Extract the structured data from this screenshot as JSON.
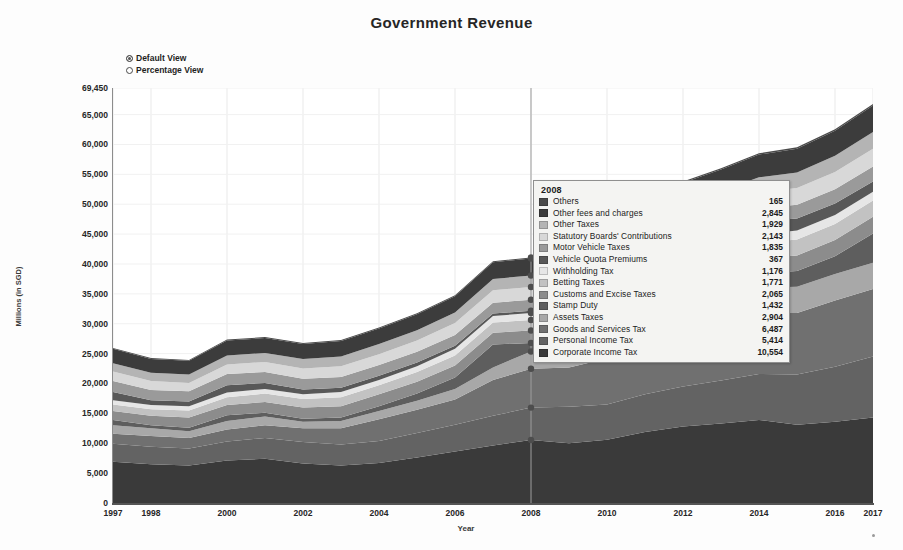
{
  "header": {
    "title": "Government Revenue"
  },
  "view_toggle": {
    "options": [
      {
        "label": "Default View",
        "selected": true
      },
      {
        "label": "Percentage View",
        "selected": false
      }
    ]
  },
  "tooltip": {
    "year": "2008",
    "rows": [
      {
        "name": "Others",
        "value": "165",
        "color": "#4a4a4a"
      },
      {
        "name": "Other fees and charges",
        "value": "2,845",
        "color": "#3c3c3c"
      },
      {
        "name": "Other Taxes",
        "value": "1,929",
        "color": "#b4b4b4"
      },
      {
        "name": "Statutory Boards' Contributions",
        "value": "2,143",
        "color": "#d8d8d8"
      },
      {
        "name": "Motor Vehicle Taxes",
        "value": "1,835",
        "color": "#9a9a9a"
      },
      {
        "name": "Vehicle Quota Premiums",
        "value": "367",
        "color": "#585858"
      },
      {
        "name": "Withholding Tax",
        "value": "1,176",
        "color": "#e6e6e6"
      },
      {
        "name": "Betting Taxes",
        "value": "1,771",
        "color": "#c2c2c2"
      },
      {
        "name": "Customs and Excise Taxes",
        "value": "2,065",
        "color": "#8c8c8c"
      },
      {
        "name": "Stamp Duty",
        "value": "1,432",
        "color": "#5e5e5e"
      },
      {
        "name": "Assets Taxes",
        "value": "2,904",
        "color": "#a8a8a8"
      },
      {
        "name": "Goods and Services Tax",
        "value": "6,487",
        "color": "#707070"
      },
      {
        "name": "Personal Income Tax",
        "value": "5,414",
        "color": "#636363"
      },
      {
        "name": "Corporate Income Tax",
        "value": "10,554",
        "color": "#3a3a3a"
      }
    ]
  },
  "chart_data": {
    "type": "area",
    "title": "Government Revenue",
    "xlabel": "Year",
    "ylabel": "Millions (in SGD)",
    "ylim": [
      0,
      69450
    ],
    "grid": true,
    "legend_position": "tooltip",
    "stacked": true,
    "y_ticks": [
      "0",
      "5,000",
      "10,000",
      "15,000",
      "20,000",
      "25,000",
      "30,000",
      "35,000",
      "40,000",
      "45,000",
      "50,000",
      "55,000",
      "60,000",
      "65,000",
      "69,450"
    ],
    "y_tick_values": [
      0,
      5000,
      10000,
      15000,
      20000,
      25000,
      30000,
      35000,
      40000,
      45000,
      50000,
      55000,
      60000,
      65000,
      69450
    ],
    "x_tick_labels": [
      "1997",
      "1998",
      "2000",
      "2002",
      "2004",
      "2006",
      "2008",
      "2010",
      "2012",
      "2014",
      "2016",
      "2017"
    ],
    "x_tick_values": [
      1997,
      1998,
      2000,
      2002,
      2004,
      2006,
      2008,
      2010,
      2012,
      2014,
      2016,
      2017
    ],
    "x": [
      1997,
      1998,
      1999,
      2000,
      2001,
      2002,
      2003,
      2004,
      2005,
      2006,
      2007,
      2008,
      2009,
      2010,
      2011,
      2012,
      2013,
      2014,
      2015,
      2016,
      2017
    ],
    "series": [
      {
        "name": "Corporate Income Tax",
        "color": "#3a3a3a",
        "values": [
          6900,
          6500,
          6300,
          7100,
          7400,
          6600,
          6300,
          6700,
          7600,
          8600,
          9600,
          10554,
          10000,
          10600,
          11900,
          12800,
          13300,
          13900,
          13100,
          13600,
          14300
        ]
      },
      {
        "name": "Personal Income Tax",
        "color": "#636363",
        "values": [
          3000,
          2900,
          2800,
          3200,
          3500,
          3600,
          3500,
          3700,
          4100,
          4500,
          5000,
          5414,
          6100,
          5900,
          6300,
          6700,
          7200,
          7700,
          8400,
          9200,
          10200
        ]
      },
      {
        "name": "Goods and Services Tax",
        "color": "#707070",
        "values": [
          1700,
          1800,
          1800,
          2000,
          2100,
          2300,
          2700,
          3600,
          3900,
          4200,
          6000,
          6487,
          6600,
          7700,
          8700,
          9000,
          9500,
          10200,
          10300,
          11100,
          11300
        ]
      },
      {
        "name": "Assets Taxes",
        "color": "#a8a8a8",
        "values": [
          1400,
          1300,
          1100,
          1400,
          1500,
          1100,
          1200,
          1400,
          1500,
          1800,
          2100,
          2904,
          2500,
          2800,
          3500,
          3800,
          4100,
          4200,
          4400,
          4400,
          4400
        ]
      },
      {
        "name": "Stamp Duty",
        "color": "#5e5e5e",
        "values": [
          900,
          500,
          600,
          1000,
          600,
          500,
          600,
          800,
          1200,
          1900,
          3800,
          1432,
          1200,
          2900,
          4000,
          3000,
          2500,
          2400,
          2600,
          3000,
          4900
        ]
      },
      {
        "name": "Customs and Excise Taxes",
        "color": "#8c8c8c",
        "values": [
          1500,
          1600,
          1700,
          1700,
          1800,
          1900,
          1900,
          2000,
          2000,
          2000,
          2000,
          2065,
          2100,
          2200,
          2300,
          2400,
          2400,
          2500,
          2600,
          2700,
          2800
        ]
      },
      {
        "name": "Betting Taxes",
        "color": "#c2c2c2",
        "values": [
          1100,
          1100,
          1200,
          1300,
          1400,
          1400,
          1500,
          1500,
          1600,
          1700,
          1700,
          1771,
          1800,
          1900,
          2300,
          2400,
          2500,
          2600,
          2700,
          2700,
          2700
        ]
      },
      {
        "name": "Withholding Tax",
        "color": "#e6e6e6",
        "values": [
          700,
          700,
          700,
          800,
          800,
          800,
          900,
          900,
          1000,
          1100,
          1100,
          1176,
          1100,
          1200,
          1300,
          1400,
          1400,
          1400,
          1500,
          1500,
          1500
        ]
      },
      {
        "name": "Vehicle Quota Premiums",
        "color": "#585858",
        "values": [
          1400,
          800,
          800,
          1200,
          1000,
          800,
          700,
          700,
          600,
          500,
          400,
          367,
          400,
          700,
          1300,
          1800,
          2100,
          2200,
          2000,
          1900,
          1700
        ]
      },
      {
        "name": "Motor Vehicle Taxes",
        "color": "#9a9a9a",
        "values": [
          1800,
          1700,
          1700,
          1900,
          1800,
          1800,
          1800,
          1800,
          1800,
          1800,
          1800,
          1835,
          1800,
          1900,
          2000,
          2100,
          2200,
          2200,
          2300,
          2400,
          2500
        ]
      },
      {
        "name": "Statutory Boards' Contributions",
        "color": "#d8d8d8",
        "values": [
          1600,
          1500,
          1400,
          1600,
          1700,
          1700,
          1800,
          1800,
          1900,
          2000,
          2100,
          2143,
          2200,
          2300,
          2400,
          2500,
          2600,
          2700,
          2800,
          2900,
          3000
        ]
      },
      {
        "name": "Other Taxes",
        "color": "#b4b4b4",
        "values": [
          1400,
          1400,
          1400,
          1500,
          1500,
          1600,
          1600,
          1700,
          1700,
          1800,
          1900,
          1929,
          2000,
          2100,
          2200,
          2300,
          2400,
          2500,
          2600,
          2700,
          2800
        ]
      },
      {
        "name": "Other fees and charges",
        "color": "#3c3c3c",
        "values": [
          2400,
          2300,
          2300,
          2500,
          2500,
          2500,
          2600,
          2600,
          2700,
          2700,
          2800,
          2845,
          2900,
          3000,
          3200,
          3400,
          3600,
          3800,
          4000,
          4200,
          4400
        ]
      },
      {
        "name": "Others",
        "color": "#4a4a4a",
        "values": [
          150,
          150,
          150,
          160,
          160,
          160,
          160,
          160,
          160,
          165,
          165,
          165,
          170,
          180,
          190,
          200,
          210,
          220,
          230,
          240,
          250
        ]
      }
    ],
    "hover": {
      "year": 2008,
      "total": "41,073"
    }
  }
}
